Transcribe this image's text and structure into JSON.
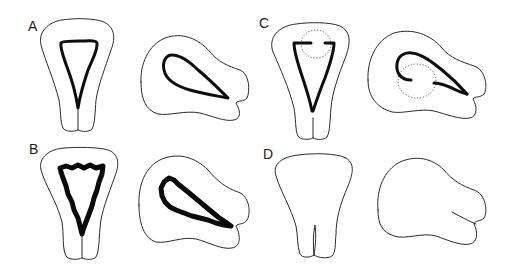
{
  "figure": {
    "width": 515,
    "height": 278,
    "colors": {
      "background": "#ffffff",
      "outline": "#2a2a2a",
      "lesion": "#0d0d0d",
      "dotted": "#555555",
      "label": "#1a1a1a"
    },
    "panels": [
      {
        "id": "A",
        "label": "A",
        "label_pos": {
          "x": 28,
          "y": 31
        },
        "front": {
          "outline": "M78 130 C74 132 65 132 63 128 C60 122 61 110 59 100 C54 80 45 60 41 45 C38 32 48 22 62 20 C74 18 94 18 104 22 C116 28 115 40 111 50 C105 68 98 86 96 100 C95 112 95 124 92 129 C89 132 82 132 78 130 L78 110",
          "lesion": "M61 43 C62 41 72 41 80 41 C88 41 96 40 97 43 C98 50 93 58 88 70 C84 82 80 95 78 108 C76 95 72 80 67 67 C63 56 60 48 61 43 Z",
          "lesion_style": "smooth"
        },
        "side": {
          "outline": "M141 82 C140 65 148 45 165 38 C182 32 198 38 210 52 C218 62 228 66 240 70 C250 74 250 92 247 98 C244 102 238 100 236 103 C240 110 242 118 234 120 C225 122 212 116 200 113 C185 110 170 116 158 114 C145 110 141 98 141 82 Z",
          "lesion": "M164 70 C162 62 166 55 172 55 C180 55 190 62 198 70 C208 78 218 88 228 98 C218 96 204 94 190 90 C176 86 166 80 164 70 Z",
          "lesion_style": "smooth"
        }
      },
      {
        "id": "B",
        "label": "B",
        "label_pos": {
          "x": 29,
          "y": 154
        },
        "front": {
          "outline": "M82 258 C78 260 68 260 66 256 C62 248 64 234 62 222 C57 202 45 185 41 170 C38 157 50 149 64 148 C78 147 98 147 108 150 C120 154 119 166 115 176 C108 196 101 212 100 228 C99 240 99 252 96 257 C93 260 86 260 82 258 L82 236",
          "lesion": "M60 168 L66 166 L72 168 L78 165 L84 168 L90 165 L96 168 L103 166 L102 174 L99 182 L97 190 L94 198 L92 206 L89 214 L86 222 L83 230 L82 234 L80 226 L78 218 L74 210 L72 202 L68 194 L66 186 L63 178 L61 172 Z",
          "lesion_style": "rough"
        },
        "side": {
          "outline": "M139 205 C138 186 145 166 162 159 C180 152 196 158 208 170 C216 180 226 188 238 192 C250 196 251 214 247 220 C244 225 238 223 236 226 C240 234 242 246 232 248 C222 250 208 242 196 239 C182 236 168 244 156 242 C144 238 139 224 139 205 Z",
          "lesion": "M162 196 L161 188 L164 182 L169 178 L174 180 L178 184 L183 188 L188 192 L194 197 L200 202 L206 207 L212 212 L218 217 L224 221 L231 226 L224 225 L216 223 L208 220 L200 218 L192 216 L184 213 L176 210 L170 207 L165 202 Z",
          "lesion_style": "rough"
        }
      },
      {
        "id": "C",
        "label": "C",
        "label_pos": {
          "x": 259,
          "y": 28
        },
        "front": {
          "outline": "M313 138 C309 140 300 140 298 136 C295 130 296 118 294 108 C289 88 280 68 273 52 C268 38 278 26 296 24 C310 22 330 22 340 26 C352 32 350 44 346 56 C338 76 332 94 331 108 C330 120 330 132 327 137 C324 140 317 140 313 138 L313 118",
          "lesion_left": "M311 43 L294 43 C294 52 298 64 302 76 C306 88 310 100 312 111",
          "lesion_right": "M325 43 L334 43 C334 52 330 64 325 78 C320 90 316 102 313 111",
          "dotted_circle": {
            "cx": 316,
            "cy": 44,
            "rx": 15,
            "ry": 14
          },
          "lesion_style": "interrupted"
        },
        "side": {
          "outline": "M368 80 C367 60 376 40 394 33 C412 28 430 34 442 48 C450 58 462 62 474 66 C486 70 488 88 484 94 C480 98 475 96 473 99 C477 106 478 116 470 118 C460 120 446 114 434 111 C420 108 404 114 392 112 C378 108 368 98 368 80 Z",
          "lesion_outer": "M411 80 C400 80 396 72 397 64 C398 56 404 52 412 53 C422 54 432 62 442 70 C452 78 460 86 467 94",
          "lesion_inner": "M434 83 C440 83 448 86 456 90 C460 92 464 93 467 94",
          "dotted_circle": {
            "cx": 417,
            "cy": 81,
            "rx": 19,
            "ry": 17
          },
          "lesion_style": "interrupted"
        }
      },
      {
        "id": "D",
        "label": "D",
        "label_pos": {
          "x": 263,
          "y": 159
        },
        "front": {
          "outline": "M314 255 C310 258 302 258 300 254 C297 246 298 236 296 226 C291 208 280 190 276 176 C272 164 282 157 298 155 C314 153 336 153 346 158 C356 164 352 176 348 186 C340 204 336 220 336 234 C335 244 336 252 332 256 C328 259 318 258 314 255 Z",
          "notch": "M314 255 C313 246 313 234 315 225 C316 232 316 244 314 255",
          "lesion_style": "none"
        },
        "side": {
          "outline": "M378 210 C376 190 384 170 400 162 C416 155 432 158 444 170 C452 180 462 186 474 190 C486 194 488 212 484 218 C480 222 475 220 474 224 C478 232 478 242 470 244 C460 246 448 240 436 236 C422 232 406 240 394 236 C382 232 378 224 378 210 Z",
          "slit": "M452 212 C460 216 468 221 476 224",
          "lesion_style": "none"
        }
      }
    ]
  }
}
